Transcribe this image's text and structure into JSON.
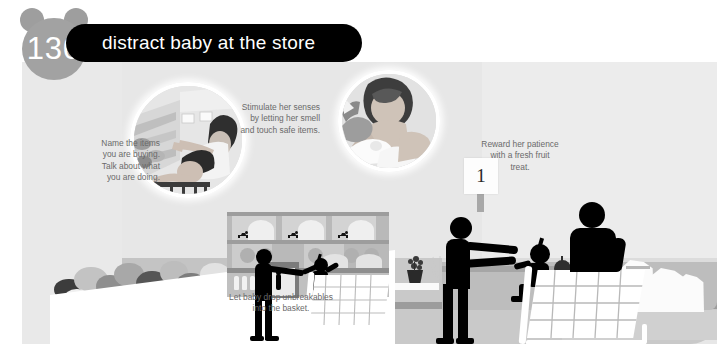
{
  "page": {
    "number": "130",
    "title": "distract baby at the store"
  },
  "captions": {
    "left": "Name the items\nyou are buying.\nTalk about what\nyou are doing.",
    "top_center": "Stimulate her senses\nby letting her smell\nand touch safe items.",
    "bottom_center": "Let baby drop unbreakables\ninto the basket.",
    "right": "Reward her patience\nwith a fresh fruit\ntreat."
  },
  "scene": {
    "aisle_sign_number": "1",
    "insets": [
      {
        "name": "pointing-at-shelves",
        "description": "mother pointing at grocery shelf items with baby in cart seat"
      },
      {
        "name": "touching-produce",
        "description": "baby touching and smelling fresh produce"
      }
    ],
    "elements": [
      "produce-bin",
      "grocery-shelving",
      "shopping-cart",
      "checkout-counter",
      "cash-register",
      "grocery-bags",
      "potted-plant"
    ]
  },
  "colors": {
    "plate_background": "#e9e9e9",
    "wall": "#e7e7e7",
    "floor": "#c9c9c9",
    "silhouette": "#000000",
    "badge": "#a2a2a2",
    "title_bar": "#000000",
    "title_text": "#ffffff",
    "caption_text": "#6a6a6a",
    "counter": "#bdbdbd",
    "cart": "#ffffff"
  }
}
